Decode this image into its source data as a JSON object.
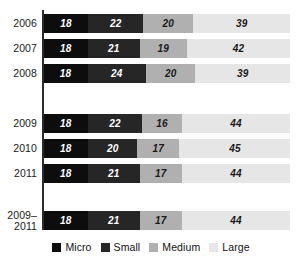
{
  "chart_data": {
    "type": "bar",
    "orientation": "horizontal",
    "stacked": true,
    "title": "",
    "subtitle": "",
    "xlabel": "",
    "ylabel": "",
    "xlim": [
      0,
      100
    ],
    "grid": false,
    "legend_position": "bottom",
    "categories": [
      "2006",
      "2007",
      "2008",
      "",
      "2009",
      "2010",
      "2011",
      "",
      "2009–\n2011"
    ],
    "series": [
      {
        "name": "Micro",
        "color": "#0d0d0d",
        "values": [
          18,
          18,
          18,
          null,
          18,
          18,
          18,
          null,
          18
        ]
      },
      {
        "name": "Small",
        "color": "#262626",
        "values": [
          22,
          21,
          24,
          null,
          22,
          20,
          21,
          null,
          21
        ]
      },
      {
        "name": "Medium",
        "color": "#b0b0b0",
        "values": [
          20,
          19,
          20,
          null,
          16,
          17,
          17,
          null,
          17
        ]
      },
      {
        "name": "Large",
        "color": "#e6e6e6",
        "values": [
          39,
          42,
          39,
          null,
          44,
          45,
          44,
          null,
          44
        ]
      }
    ],
    "rows": [
      {
        "label": "2006",
        "spacer": false,
        "two_line": false,
        "top": 4,
        "micro": "18",
        "small": "22",
        "medium": "20",
        "large": "39"
      },
      {
        "label": "2007",
        "spacer": false,
        "two_line": false,
        "top": 29,
        "micro": "18",
        "small": "21",
        "medium": "19",
        "large": "42"
      },
      {
        "label": "2008",
        "spacer": false,
        "two_line": false,
        "top": 54,
        "micro": "18",
        "small": "24",
        "medium": "20",
        "large": "39"
      },
      {
        "label": "2009",
        "spacer": false,
        "two_line": false,
        "top": 104,
        "micro": "18",
        "small": "22",
        "medium": "16",
        "large": "44"
      },
      {
        "label": "2010",
        "spacer": false,
        "two_line": false,
        "top": 129,
        "micro": "18",
        "small": "20",
        "medium": "17",
        "large": "45"
      },
      {
        "label": "2011",
        "spacer": false,
        "two_line": false,
        "top": 154,
        "micro": "18",
        "small": "21",
        "medium": "17",
        "large": "44"
      },
      {
        "label": "2009–\n2011",
        "spacer": false,
        "two_line": true,
        "top": 201,
        "micro": "18",
        "small": "21",
        "medium": "17",
        "large": "44"
      }
    ]
  },
  "legend": {
    "items": [
      {
        "label": "Micro",
        "color": "#0d0d0d"
      },
      {
        "label": "Small",
        "color": "#262626"
      },
      {
        "label": "Medium",
        "color": "#b0b0b0"
      },
      {
        "label": "Large",
        "color": "#e6e6e6"
      }
    ]
  }
}
